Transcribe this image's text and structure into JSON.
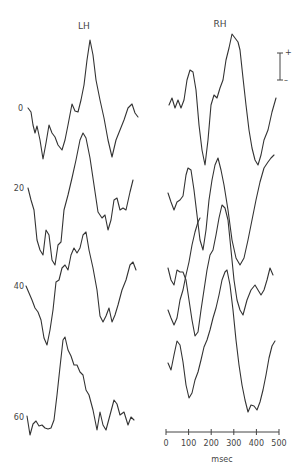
{
  "chart_data": {
    "type": "line",
    "title": "",
    "panels": [
      {
        "name": "LH",
        "title": "LH"
      },
      {
        "name": "RH",
        "title": "RH"
      }
    ],
    "row_labels": [
      "0",
      "20",
      "40",
      "60"
    ],
    "xlabel": "msec",
    "x_ticks": [
      "0",
      "100",
      "200",
      "300",
      "400",
      "500"
    ],
    "xlim": [
      0,
      500
    ],
    "polarity_bar": {
      "top": "+",
      "bottom": "–"
    },
    "note": "Evoked-potential waveforms; traces stacked per row label, approx. pixel paths",
    "series": [
      {
        "name": "LH-0",
        "points": [
          [
            28,
            108
          ],
          [
            31,
            112
          ],
          [
            33,
            125
          ],
          [
            35,
            133
          ],
          [
            37,
            126
          ],
          [
            40,
            140
          ],
          [
            43,
            159
          ],
          [
            46,
            143
          ],
          [
            49,
            125
          ],
          [
            52,
            133
          ],
          [
            55,
            137
          ],
          [
            58,
            145
          ],
          [
            62,
            150
          ],
          [
            65,
            140
          ],
          [
            68,
            125
          ],
          [
            72,
            104
          ],
          [
            75,
            111
          ],
          [
            78,
            112
          ],
          [
            81,
            100
          ],
          [
            84,
            85
          ],
          [
            87,
            60
          ],
          [
            90,
            40
          ],
          [
            93,
            55
          ],
          [
            96,
            80
          ],
          [
            100,
            100
          ],
          [
            104,
            118
          ],
          [
            108,
            140
          ],
          [
            112,
            157
          ],
          [
            116,
            140
          ],
          [
            120,
            130
          ],
          [
            124,
            120
          ],
          [
            128,
            108
          ],
          [
            132,
            104
          ],
          [
            135,
            113
          ],
          [
            138,
            117
          ]
        ]
      },
      {
        "name": "LH-20",
        "points": [
          [
            28,
            188
          ],
          [
            31,
            200
          ],
          [
            34,
            210
          ],
          [
            37,
            240
          ],
          [
            40,
            250
          ],
          [
            43,
            255
          ],
          [
            46,
            230
          ],
          [
            49,
            235
          ],
          [
            52,
            260
          ],
          [
            55,
            265
          ],
          [
            58,
            245
          ],
          [
            61,
            242
          ],
          [
            64,
            210
          ],
          [
            68,
            195
          ],
          [
            72,
            178
          ],
          [
            76,
            160
          ],
          [
            80,
            140
          ],
          [
            83,
            133
          ],
          [
            86,
            138
          ],
          [
            90,
            158
          ],
          [
            94,
            185
          ],
          [
            98,
            212
          ],
          [
            102,
            218
          ],
          [
            105,
            215
          ],
          [
            108,
            230
          ],
          [
            111,
            220
          ],
          [
            114,
            200
          ],
          [
            117,
            198
          ],
          [
            120,
            210
          ],
          [
            123,
            208
          ],
          [
            126,
            210
          ],
          [
            130,
            192
          ],
          [
            133,
            180
          ]
        ]
      },
      {
        "name": "LH-40",
        "points": [
          [
            26,
            286
          ],
          [
            29,
            293
          ],
          [
            32,
            300
          ],
          [
            35,
            308
          ],
          [
            38,
            312
          ],
          [
            41,
            320
          ],
          [
            44,
            338
          ],
          [
            47,
            345
          ],
          [
            50,
            330
          ],
          [
            53,
            310
          ],
          [
            56,
            282
          ],
          [
            59,
            280
          ],
          [
            62,
            268
          ],
          [
            65,
            265
          ],
          [
            68,
            270
          ],
          [
            71,
            255
          ],
          [
            74,
            248
          ],
          [
            77,
            253
          ],
          [
            80,
            248
          ],
          [
            83,
            235
          ],
          [
            86,
            232
          ],
          [
            89,
            250
          ],
          [
            93,
            268
          ],
          [
            97,
            290
          ],
          [
            100,
            316
          ],
          [
            103,
            322
          ],
          [
            106,
            316
          ],
          [
            109,
            308
          ],
          [
            112,
            322
          ],
          [
            115,
            315
          ],
          [
            118,
            305
          ],
          [
            122,
            290
          ],
          [
            126,
            280
          ],
          [
            130,
            265
          ],
          [
            133,
            262
          ],
          [
            136,
            270
          ]
        ]
      },
      {
        "name": "LH-60",
        "points": [
          [
            27,
            416
          ],
          [
            30,
            435
          ],
          [
            33,
            424
          ],
          [
            36,
            421
          ],
          [
            39,
            426
          ],
          [
            42,
            425
          ],
          [
            45,
            428
          ],
          [
            48,
            429
          ],
          [
            51,
            428
          ],
          [
            54,
            420
          ],
          [
            57,
            395
          ],
          [
            60,
            367
          ],
          [
            63,
            340
          ],
          [
            65,
            337
          ],
          [
            68,
            350
          ],
          [
            71,
            356
          ],
          [
            74,
            365
          ],
          [
            77,
            365
          ],
          [
            80,
            372
          ],
          [
            83,
            375
          ],
          [
            86,
            390
          ],
          [
            89,
            395
          ],
          [
            93,
            410
          ],
          [
            97,
            430
          ],
          [
            100,
            412
          ],
          [
            103,
            425
          ],
          [
            106,
            430
          ],
          [
            110,
            415
          ],
          [
            114,
            400
          ],
          [
            117,
            404
          ],
          [
            120,
            415
          ],
          [
            124,
            412
          ],
          [
            128,
            425
          ],
          [
            131,
            417
          ],
          [
            134,
            420
          ]
        ]
      },
      {
        "name": "RH-0",
        "points": [
          [
            169,
            105
          ],
          [
            172,
            98
          ],
          [
            175,
            108
          ],
          [
            178,
            100
          ],
          [
            181,
            108
          ],
          [
            184,
            100
          ],
          [
            187,
            80
          ],
          [
            190,
            70
          ],
          [
            193,
            72
          ],
          [
            196,
            90
          ],
          [
            199,
            125
          ],
          [
            202,
            150
          ],
          [
            205,
            165
          ],
          [
            208,
            140
          ],
          [
            211,
            105
          ],
          [
            214,
            95
          ],
          [
            217,
            98
          ],
          [
            220,
            88
          ],
          [
            223,
            80
          ],
          [
            226,
            60
          ],
          [
            229,
            48
          ],
          [
            232,
            34
          ],
          [
            235,
            38
          ],
          [
            238,
            42
          ],
          [
            240,
            50
          ],
          [
            243,
            78
          ],
          [
            246,
            105
          ],
          [
            249,
            130
          ],
          [
            252,
            148
          ],
          [
            255,
            160
          ],
          [
            258,
            165
          ],
          [
            261,
            155
          ],
          [
            264,
            140
          ],
          [
            268,
            130
          ],
          [
            272,
            112
          ],
          [
            276,
            98
          ]
        ]
      },
      {
        "name": "RH-20",
        "points": [
          [
            168,
            193
          ],
          [
            171,
            202
          ],
          [
            174,
            210
          ],
          [
            177,
            202
          ],
          [
            180,
            200
          ],
          [
            183,
            196
          ],
          [
            186,
            175
          ],
          [
            188,
            168
          ],
          [
            191,
            170
          ],
          [
            194,
            190
          ],
          [
            197,
            215
          ],
          [
            200,
            240
          ],
          [
            203,
            250
          ],
          [
            206,
            230
          ],
          [
            209,
            200
          ],
          [
            212,
            180
          ],
          [
            215,
            165
          ],
          [
            218,
            158
          ],
          [
            221,
            170
          ],
          [
            224,
            185
          ],
          [
            228,
            210
          ],
          [
            232,
            240
          ],
          [
            236,
            258
          ],
          [
            240,
            265
          ],
          [
            244,
            258
          ],
          [
            248,
            240
          ],
          [
            252,
            220
          ],
          [
            256,
            200
          ],
          [
            260,
            182
          ],
          [
            264,
            168
          ],
          [
            268,
            162
          ],
          [
            271,
            158
          ],
          [
            274,
            155
          ]
        ]
      },
      {
        "name": "RH-40",
        "points": [
          [
            168,
            268
          ],
          [
            171,
            280
          ],
          [
            174,
            285
          ],
          [
            177,
            270
          ],
          [
            180,
            272
          ],
          [
            183,
            272
          ],
          [
            186,
            280
          ],
          [
            189,
            300
          ],
          [
            192,
            320
          ],
          [
            195,
            336
          ],
          [
            198,
            332
          ],
          [
            201,
            310
          ],
          [
            204,
            290
          ],
          [
            207,
            270
          ],
          [
            210,
            255
          ],
          [
            213,
            250
          ],
          [
            216,
            235
          ],
          [
            219,
            218
          ],
          [
            222,
            205
          ],
          [
            225,
            208
          ],
          [
            228,
            220
          ],
          [
            231,
            250
          ],
          [
            234,
            280
          ],
          [
            237,
            300
          ],
          [
            240,
            310
          ],
          [
            243,
            315
          ],
          [
            247,
            300
          ],
          [
            251,
            290
          ],
          [
            255,
            285
          ],
          [
            258,
            290
          ],
          [
            261,
            295
          ],
          [
            264,
            290
          ],
          [
            267,
            280
          ],
          [
            270,
            268
          ],
          [
            273,
            275
          ]
        ]
      },
      {
        "name": "RH-40b",
        "points": [
          [
            168,
            310
          ],
          [
            171,
            318
          ],
          [
            174,
            325
          ],
          [
            177,
            318
          ],
          [
            180,
            300
          ],
          [
            183,
            290
          ],
          [
            186,
            275
          ],
          [
            189,
            262
          ],
          [
            192,
            245
          ],
          [
            195,
            232
          ],
          [
            198,
            222
          ],
          [
            200,
            218
          ]
        ]
      },
      {
        "name": "RH-60",
        "points": [
          [
            168,
            363
          ],
          [
            171,
            370
          ],
          [
            174,
            355
          ],
          [
            177,
            341
          ],
          [
            180,
            345
          ],
          [
            183,
            362
          ],
          [
            186,
            385
          ],
          [
            189,
            398
          ],
          [
            192,
            393
          ],
          [
            195,
            380
          ],
          [
            198,
            372
          ],
          [
            201,
            360
          ],
          [
            204,
            347
          ],
          [
            207,
            340
          ],
          [
            210,
            330
          ],
          [
            213,
            318
          ],
          [
            216,
            308
          ],
          [
            219,
            295
          ],
          [
            222,
            280
          ],
          [
            225,
            272
          ],
          [
            227,
            270
          ],
          [
            230,
            285
          ],
          [
            233,
            310
          ],
          [
            236,
            340
          ],
          [
            239,
            365
          ],
          [
            242,
            385
          ],
          [
            245,
            400
          ],
          [
            248,
            412
          ],
          [
            251,
            405
          ],
          [
            254,
            406
          ],
          [
            257,
            410
          ],
          [
            260,
            402
          ],
          [
            263,
            390
          ],
          [
            266,
            375
          ],
          [
            269,
            358
          ],
          [
            272,
            346
          ],
          [
            275,
            341
          ]
        ]
      }
    ],
    "axis": {
      "x0_px": 166,
      "x500_px": 279,
      "y_px": 432
    }
  }
}
